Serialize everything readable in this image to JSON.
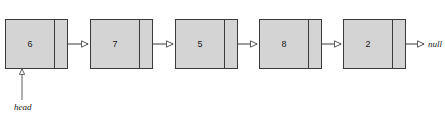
{
  "diagram": {
    "canvas": {
      "width": 445,
      "height": 123,
      "background": "#ffffff"
    },
    "style": {
      "node_fill": "#d4d4d4",
      "node_stroke": "#3a3a3a",
      "line_color": "#3a3a3a",
      "text_color": "#1a1a1a"
    },
    "nodes": [
      {
        "id": "node-1",
        "value": "6",
        "x": 5,
        "y": 19,
        "width": 63,
        "height": 50,
        "pointer_divider_x": 48
      },
      {
        "id": "node-2",
        "value": "7",
        "x": 90,
        "y": 19,
        "width": 63,
        "height": 50,
        "pointer_divider_x": 48
      },
      {
        "id": "node-3",
        "value": "5",
        "x": 175,
        "y": 19,
        "width": 63,
        "height": 50,
        "pointer_divider_x": 48
      },
      {
        "id": "node-4",
        "value": "8",
        "x": 259,
        "y": 19,
        "width": 63,
        "height": 50,
        "pointer_divider_x": 48
      },
      {
        "id": "node-5",
        "value": "2",
        "x": 343,
        "y": 19,
        "width": 63,
        "height": 50,
        "pointer_divider_x": 48
      }
    ],
    "links": [
      {
        "from": "node-1",
        "to": "node-2",
        "x1": 53,
        "x2": 88,
        "y": 44
      },
      {
        "from": "node-2",
        "to": "node-3",
        "x1": 138,
        "x2": 173,
        "y": 44
      },
      {
        "from": "node-3",
        "to": "node-4",
        "x1": 223,
        "x2": 257,
        "y": 44
      },
      {
        "from": "node-4",
        "to": "node-5",
        "x1": 307,
        "x2": 341,
        "y": 44
      },
      {
        "from": "node-5",
        "to": "null",
        "x1": 391,
        "x2": 424,
        "y": 44
      }
    ],
    "null_label": {
      "text": "null",
      "x": 428,
      "y": 40
    },
    "head_pointer": {
      "label": "head",
      "label_x": 14,
      "label_y": 103,
      "line_x": 22,
      "line_y1": 100,
      "line_y2": 74,
      "arrow_tip_y": 69
    }
  }
}
